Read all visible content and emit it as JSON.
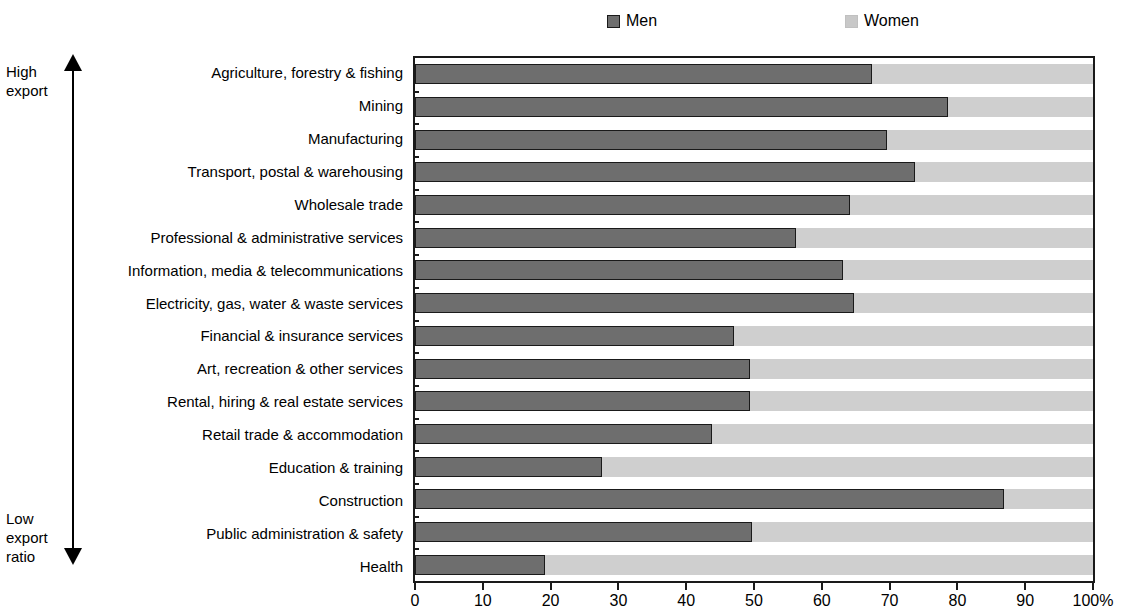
{
  "legend": {
    "entries": [
      {
        "label": "Men",
        "color": "#6e6e6e"
      },
      {
        "label": "Women",
        "color": "#cfcfcf"
      }
    ]
  },
  "axis_annotation": {
    "top": "High\nexport",
    "bottom": "Low\nexport\nratio"
  },
  "chart_data": {
    "type": "bar",
    "orientation": "horizontal",
    "stacked": true,
    "stacked_total": 100,
    "title": "",
    "subtitle": "",
    "xlabel": "",
    "ylabel": "",
    "xlim": [
      0,
      100
    ],
    "grid": false,
    "legend_position": "top",
    "xticks": [
      0,
      10,
      20,
      30,
      40,
      50,
      60,
      70,
      80,
      90,
      100
    ],
    "xtick_labels": [
      "0",
      "10",
      "20",
      "30",
      "40",
      "50",
      "60",
      "70",
      "80",
      "90",
      "100%"
    ],
    "categories": [
      "Agriculture, forestry & fishing",
      "Mining",
      "Manufacturing",
      "Transport, postal & warehousing",
      "Wholesale trade",
      "Professional & administrative services",
      "Information, media & telecommunications",
      "Electricity, gas, water & waste services",
      "Financial & insurance services",
      "Art, recreation & other services",
      "Rental, hiring & real estate services",
      "Retail trade & accommodation",
      "Education & training",
      "Construction",
      "Public administration & safety",
      "Health"
    ],
    "series": [
      {
        "name": "Men",
        "color": "#6e6e6e",
        "values": [
          67.4,
          78.6,
          69.6,
          73.7,
          64.2,
          56.2,
          63.2,
          64.7,
          47.1,
          49.4,
          49.4,
          43.8,
          27.6,
          86.9,
          49.7,
          19.2
        ]
      },
      {
        "name": "Women",
        "color": "#cfcfcf",
        "values": [
          32.6,
          21.4,
          30.4,
          26.3,
          35.8,
          43.8,
          36.8,
          35.3,
          52.9,
          50.6,
          50.6,
          56.2,
          72.4,
          13.1,
          50.3,
          80.8
        ]
      }
    ]
  }
}
